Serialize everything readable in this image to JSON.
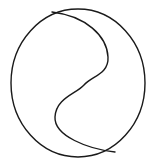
{
  "figure": {
    "name": "yin-yang-outline",
    "title": "Yin Yang symbol outline",
    "background_color": "#ffffff",
    "stroke_color": "#1a1a1a",
    "stroke_width": 1.4,
    "fill": "none",
    "canvas": {
      "width": 158,
      "height": 167
    },
    "outer_circle": {
      "name": "outer-circle",
      "center_x": 78,
      "center_y": 83,
      "radius_x": 67,
      "radius_y": 74,
      "left": 11,
      "right": 145,
      "top": 9,
      "bottom": 157
    },
    "divider_curve": {
      "name": "s-divider-curve",
      "shape": "s-curve",
      "start_x": 52,
      "start_y": 12,
      "end_x": 115,
      "end_y": 152,
      "inflection_x": 82,
      "inflection_y": 84,
      "upper_bulge_extent_x": 108,
      "lower_bulge_extent_x": 55,
      "path": "M 52 12 C 86 16 107 36 108 57 C 109 74 92 76 84 85 C 76 94 56 98 55 117 C 54 136 88 149 115 152"
    }
  }
}
